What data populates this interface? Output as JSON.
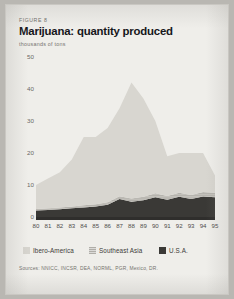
{
  "figure": {
    "number_label": "FIGURE 8",
    "title": "Marijuana: quantity produced",
    "subtitle": "thousands of tons",
    "sources": "Sources: NNICC, INCSR, DEA, NORML, PGR, Mexico, DR."
  },
  "legend": {
    "items": [
      {
        "label": "Ibero-America",
        "color": "#d6d4ce"
      },
      {
        "label": "Southeast Asia",
        "color": "#b0aea8"
      },
      {
        "label": "U.S.A.",
        "color": "#3a3936"
      }
    ]
  },
  "chart_data": {
    "type": "area",
    "stacked": true,
    "title": "Marijuana: quantity produced",
    "subtitle": "thousands of tons",
    "xlabel": "",
    "ylabel": "thousands of tons",
    "grid": false,
    "legend_position": "bottom",
    "ylim": [
      0,
      50
    ],
    "yticks": [
      0,
      10,
      20,
      30,
      40,
      50
    ],
    "categories": [
      "80",
      "81",
      "82",
      "83",
      "84",
      "85",
      "86",
      "87",
      "88",
      "89",
      "90",
      "91",
      "92",
      "93",
      "94",
      "95"
    ],
    "series": [
      {
        "name": "U.S.A.",
        "color": "#3a3936",
        "values": [
          2.0,
          2.2,
          2.4,
          2.7,
          3.0,
          3.3,
          3.8,
          5.6,
          4.8,
          5.2,
          6.2,
          5.4,
          6.3,
          5.6,
          6.4,
          6.2
        ]
      },
      {
        "name": "Southeast Asia",
        "color": "#b0aea8",
        "values": [
          0.5,
          0.5,
          0.6,
          0.6,
          0.7,
          0.7,
          0.8,
          0.9,
          1.0,
          1.1,
          1.2,
          1.2,
          1.3,
          1.3,
          1.4,
          1.4
        ]
      },
      {
        "name": "Ibero-America",
        "color": "#d6d4ce",
        "values": [
          7.5,
          9.3,
          11.0,
          14.7,
          21.3,
          21.0,
          23.2,
          27.5,
          36.2,
          30.7,
          22.6,
          12.4,
          12.4,
          13.1,
          12.2,
          5.4
        ]
      }
    ],
    "stack_totals": [
      10.0,
      12.0,
      14.0,
      18.0,
      25.0,
      25.0,
      27.8,
      34.0,
      42.0,
      37.0,
      30.0,
      19.0,
      20.0,
      20.0,
      20.0,
      13.0
    ],
    "annotations": [
      {
        "text": "peak at 1988",
        "x": "88",
        "y": 42
      }
    ]
  }
}
